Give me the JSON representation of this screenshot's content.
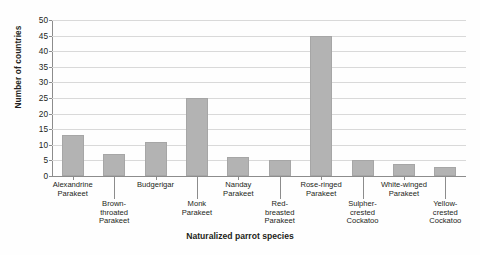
{
  "chart_data": {
    "type": "bar",
    "title": "",
    "xlabel": "Naturalized parrot species",
    "ylabel": "Number of countries",
    "ylim": [
      0,
      50
    ],
    "ytick_step": 5,
    "yticks": [
      0,
      5,
      10,
      15,
      20,
      25,
      30,
      35,
      40,
      45,
      50
    ],
    "grid": true,
    "legend": "none",
    "bar_color": "#b3b3b3",
    "bar_border_color": "#a6a6a6",
    "axis_color": "#8c8c8c",
    "gridline_color": "#d9d9d9",
    "categories": [
      "Alexandrine\nParakeet",
      "Brown-\nthroated\nParakeet",
      "Budgerigar",
      "Monk\nParakeet",
      "Nanday\nParakeet",
      "Red-\nbreasted\nParakeet",
      "Rose-ringed\nParakeet",
      "Sulpher-\ncrested\nCockatoo",
      "White-winged\nParakeet",
      "Yellow-\ncrested\nCockatoo"
    ],
    "values": [
      13,
      7,
      11,
      25,
      6,
      5,
      45,
      5,
      4,
      3
    ],
    "label_rows": [
      0,
      1,
      0,
      1,
      0,
      1,
      0,
      1,
      0,
      1
    ]
  }
}
